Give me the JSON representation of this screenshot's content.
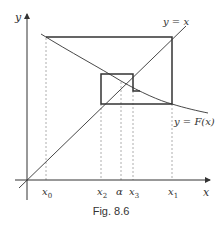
{
  "figure": {
    "caption": "Fig. 8.6",
    "axes": {
      "x_label": "x",
      "y_label": "y"
    },
    "curves": {
      "identity_label": "y = x",
      "function_label": "y = F(x)"
    },
    "ticks": [
      {
        "id": "x0",
        "label": "x",
        "sub": "0"
      },
      {
        "id": "x2",
        "label": "x",
        "sub": "2"
      },
      {
        "id": "alpha",
        "label": "α",
        "sub": ""
      },
      {
        "id": "x3",
        "label": "x",
        "sub": "3"
      },
      {
        "id": "x1",
        "label": "x",
        "sub": "1"
      }
    ],
    "colors": {
      "line": "#333333",
      "dashed": "#999999",
      "background": "#ffffff"
    }
  }
}
